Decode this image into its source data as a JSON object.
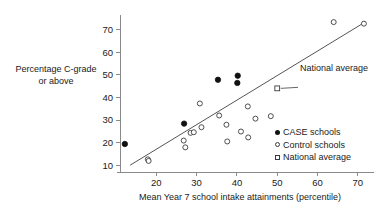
{
  "chart_data": {
    "type": "scatter",
    "title": "",
    "xlabel": "Mean Year 7 school intake attainments (percentile)",
    "ylabel_line1": "Percentage C-grade",
    "ylabel_line2": "or above",
    "xlim": [
      11,
      74
    ],
    "ylim": [
      7,
      76
    ],
    "xticks": [
      20,
      30,
      40,
      50,
      60,
      70
    ],
    "yticks": [
      10,
      20,
      30,
      40,
      50,
      60,
      70
    ],
    "grid": false,
    "legend_position": "bottom-right",
    "legend": [
      {
        "label": "CASE schools",
        "marker": "filled-circle"
      },
      {
        "label": "Control schools",
        "marker": "open-circle"
      },
      {
        "label": "National average",
        "marker": "open-square"
      }
    ],
    "annotations": [
      {
        "text": "National average",
        "x": 50.0,
        "y": 44.0,
        "leader": true
      }
    ],
    "fit_line": {
      "x1": 13.5,
      "y1": 10.0,
      "x2": 71.5,
      "y2": 73.0
    },
    "series": [
      {
        "name": "CASE schools",
        "marker": "filled-circle",
        "points": [
          {
            "x": 12.2,
            "y": 19.4
          },
          {
            "x": 26.9,
            "y": 28.4
          },
          {
            "x": 35.3,
            "y": 47.8
          },
          {
            "x": 40.2,
            "y": 49.6
          },
          {
            "x": 40.1,
            "y": 46.4
          }
        ]
      },
      {
        "name": "Control schools",
        "marker": "open-circle",
        "points": [
          {
            "x": 17.9,
            "y": 12.6
          },
          {
            "x": 18.1,
            "y": 11.9
          },
          {
            "x": 26.8,
            "y": 20.9
          },
          {
            "x": 27.2,
            "y": 17.9
          },
          {
            "x": 28.5,
            "y": 24.3
          },
          {
            "x": 29.3,
            "y": 24.6
          },
          {
            "x": 30.8,
            "y": 37.3
          },
          {
            "x": 31.2,
            "y": 26.8
          },
          {
            "x": 35.6,
            "y": 32.0
          },
          {
            "x": 37.4,
            "y": 27.9
          },
          {
            "x": 37.6,
            "y": 20.5
          },
          {
            "x": 41.0,
            "y": 24.9
          },
          {
            "x": 42.7,
            "y": 36.0
          },
          {
            "x": 42.8,
            "y": 22.3
          },
          {
            "x": 44.6,
            "y": 30.6
          },
          {
            "x": 48.4,
            "y": 31.7
          },
          {
            "x": 64.0,
            "y": 73.3
          },
          {
            "x": 71.5,
            "y": 72.6
          }
        ]
      },
      {
        "name": "National average",
        "marker": "open-square",
        "points": [
          {
            "x": 50.0,
            "y": 44.0
          }
        ]
      }
    ]
  }
}
